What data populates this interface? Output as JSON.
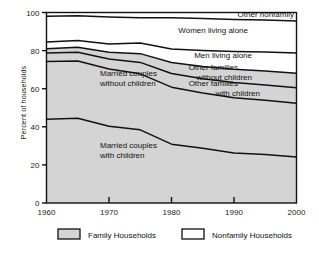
{
  "chart_data": {
    "type": "area",
    "title": "",
    "subtitle": "",
    "xlabel": "",
    "ylabel": "Percent of households",
    "xlim": [
      1960,
      2000
    ],
    "ylim": [
      0,
      100
    ],
    "grid": false,
    "stacked": true,
    "legend_position": "bottom",
    "x": [
      1960,
      1965,
      1970,
      1975,
      1980,
      1985,
      1990,
      1995,
      2000
    ],
    "xticks": [
      1960,
      1970,
      1980,
      1990,
      2000
    ],
    "xtick_labels": [
      "1960",
      "1970",
      "1980",
      "1990",
      "2000"
    ],
    "yticks": [
      0,
      20,
      40,
      60,
      80,
      100
    ],
    "ytick_labels": [
      "0",
      "20",
      "40",
      "60",
      "80",
      "100"
    ],
    "series": [
      {
        "name": "Married couples with children",
        "label": "Married couples\nwith children",
        "label_line1": "Married couples",
        "label_line2": "with children",
        "group": "Family Households",
        "fill": "#d4d4d4",
        "values": [
          44.0,
          44.5,
          40.3,
          38.4,
          30.9,
          28.7,
          26.3,
          25.5,
          24.1
        ],
        "cumulative": [
          44.0,
          44.5,
          40.3,
          38.4,
          30.9,
          28.7,
          26.3,
          25.5,
          24.1
        ]
      },
      {
        "name": "Married couples without children",
        "label": "Married couples\nwithout children",
        "label_line1": "Married couples",
        "label_line2": "without children",
        "group": "Family Households",
        "fill": "#d4d4d4",
        "values": [
          30.3,
          30.0,
          30.0,
          29.4,
          29.9,
          29.0,
          29.0,
          28.5,
          28.3
        ],
        "cumulative": [
          74.3,
          74.5,
          70.3,
          67.8,
          60.8,
          57.7,
          55.3,
          54.0,
          52.4
        ]
      },
      {
        "name": "Other families with children",
        "label": "Other families\nwith children",
        "label_line1": "Other families",
        "label_line2": "with children",
        "group": "Family Households",
        "fill": "#d4d4d4",
        "values": [
          4.4,
          4.6,
          5.3,
          6.0,
          7.2,
          7.5,
          7.9,
          8.0,
          8.1
        ],
        "cumulative": [
          78.7,
          79.1,
          75.6,
          73.8,
          68.0,
          65.2,
          63.2,
          62.0,
          60.5
        ]
      },
      {
        "name": "Other families without children",
        "label": "Other families\nwithout children",
        "label_line1": "Other families",
        "label_line2": "without children",
        "group": "Family Households",
        "fill": "#d4d4d4",
        "values": [
          2.3,
          2.6,
          3.5,
          4.6,
          5.8,
          6.5,
          7.0,
          7.3,
          7.6
        ],
        "cumulative": [
          81.0,
          81.7,
          79.1,
          78.4,
          73.8,
          71.7,
          70.2,
          69.3,
          68.1
        ]
      },
      {
        "name": "Men living alone",
        "label": "Men living alone",
        "label_line1": "Men living alone",
        "label_line2": "",
        "group": "Nonfamily Households",
        "fill": "#ffffff",
        "values": [
          3.5,
          3.6,
          4.4,
          5.6,
          7.0,
          8.3,
          9.3,
          10.0,
          10.7
        ],
        "cumulative": [
          84.5,
          85.3,
          83.5,
          84.0,
          80.8,
          80.0,
          79.5,
          79.3,
          78.8
        ]
      },
      {
        "name": "Women living alone",
        "label": "Women living alone",
        "label_line1": "Women living alone",
        "label_line2": "",
        "group": "Nonfamily Households",
        "fill": "#ffffff",
        "values": [
          13.5,
          13.0,
          14.2,
          13.3,
          16.5,
          16.8,
          16.8,
          16.8,
          16.7
        ],
        "cumulative": [
          98.0,
          98.3,
          97.7,
          97.3,
          97.3,
          96.8,
          96.3,
          96.1,
          95.5
        ]
      },
      {
        "name": "Other nonfamily",
        "label": "Other nonfamily",
        "label_line1": "Other nonfamily",
        "label_line2": "",
        "group": "Nonfamily Households",
        "fill": "#ffffff",
        "values": [
          2.0,
          1.7,
          2.3,
          2.7,
          2.7,
          3.2,
          3.7,
          3.9,
          4.5
        ],
        "cumulative": [
          100,
          100,
          100,
          100,
          100,
          100,
          100,
          100,
          100
        ]
      }
    ],
    "legend": [
      {
        "label": "Family Households",
        "swatch": "#d4d4d4",
        "border": "#111111"
      },
      {
        "label": "Nonfamily Households",
        "swatch": "#ffffff",
        "border": "#111111"
      }
    ],
    "colors": {
      "family_fill": "#d4d4d4",
      "nonfamily_fill": "#ffffff",
      "line": "#111111",
      "axis": "#111111",
      "text": "#1a1a1a"
    }
  }
}
